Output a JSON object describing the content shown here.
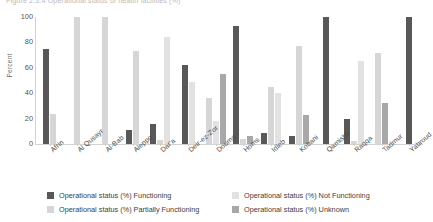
{
  "figure": {
    "caption_clipped": "Figure 2.3.4   Operational status of health facilities (%)",
    "axis_y_title": "Percent"
  },
  "chart_data": {
    "type": "bar",
    "title": "",
    "xlabel": "",
    "ylabel": "Percent",
    "ylim": [
      0,
      100
    ],
    "yticks": [
      0,
      20,
      40,
      60,
      80,
      100
    ],
    "grid": false,
    "legend_position": "bottom",
    "categories": [
      "Afrin",
      "Al Qusayr",
      "Al-Bab",
      "Aleppo",
      "Dar'a",
      "Deir-ez-Zor",
      "Douma",
      "Homs",
      "Idleb",
      "Kobani",
      "Qamishli",
      "Raqqa",
      "Tadmur",
      "Yabroud"
    ],
    "series": [
      {
        "name": "Operational status (%) Functioning",
        "color": "#585858",
        "values": [
          75,
          null,
          null,
          11,
          16,
          62,
          null,
          93,
          9,
          6,
          100,
          20,
          null,
          100
        ]
      },
      {
        "name": "Operational status (%) Partially Functioning",
        "color": "#d6d6d6",
        "values": [
          24,
          100,
          100,
          73,
          3,
          null,
          36,
          4,
          45,
          77,
          null,
          2,
          72,
          null
        ]
      },
      {
        "name": "Operational status (%) Not Functioning",
        "color": "#e2e2e2",
        "values": [
          null,
          null,
          null,
          null,
          84,
          49,
          18,
          null,
          40,
          null,
          null,
          65,
          null,
          null
        ]
      },
      {
        "name": "Operational status (%) Unknown",
        "color": "#a8a8a8",
        "values": [
          null,
          null,
          null,
          null,
          null,
          null,
          55,
          6,
          null,
          23,
          null,
          null,
          32,
          null
        ]
      }
    ]
  },
  "legend": {
    "items": [
      {
        "label": "Operational status (%) Functioning",
        "color": "#585858"
      },
      {
        "label": "Operational status (%) Not Functioning",
        "color": "#e2e2e2"
      },
      {
        "label": "Operational status (%) Partially Functioning",
        "color": "#d6d6d6"
      },
      {
        "label": "Operational status (%) Unknown",
        "color": "#a8a8a8"
      }
    ]
  }
}
